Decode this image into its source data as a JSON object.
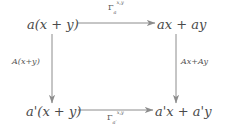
{
  "diagram": {
    "type": "commutative-square",
    "background_color": "#ffffff",
    "stroke_color": "#8c8c8c",
    "text_color": "#4a4a4a",
    "nodes": {
      "top_left": {
        "text": "a(x + y)",
        "position": "top-left"
      },
      "top_right": {
        "text": "ax + ay",
        "position": "top-right"
      },
      "bottom_left": {
        "text": "a'(x + y)",
        "position": "bottom-left"
      },
      "bottom_right": {
        "text": "a'x + a'y",
        "position": "bottom-right"
      }
    },
    "edges": {
      "top": {
        "label": "Γ_a^{x,y}",
        "label_plain": "Gamma_a^{x,y}",
        "direction": "right",
        "from": "top_left",
        "to": "top_right"
      },
      "bottom": {
        "label": "Γ_{a'}^{x,y}",
        "label_plain": "Gamma_{a'}^{x,y}",
        "direction": "right",
        "from": "bottom_left",
        "to": "bottom_right"
      },
      "left": {
        "label": "A(x+y)",
        "direction": "down",
        "from": "top_left",
        "to": "bottom_left"
      },
      "right": {
        "label": "Ax+Ay",
        "direction": "down",
        "from": "top_right",
        "to": "bottom_right"
      }
    },
    "symbols": {
      "gamma": "Γ",
      "prime": "′",
      "plus": "+",
      "comma": ","
    },
    "tokens": {
      "a": "a",
      "x": "x",
      "y": "y",
      "A": "A",
      "ax": "ax",
      "ay": "ay",
      "open_paren": "(",
      "close_paren": ")"
    }
  }
}
